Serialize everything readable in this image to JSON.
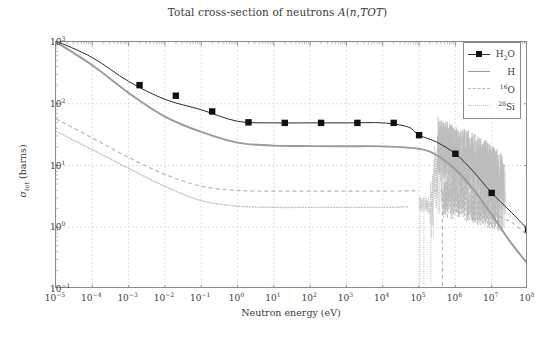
{
  "chart_data": {
    "type": "line",
    "title": "Total cross-section of neutrons A(n,TOT)",
    "xlabel": "Neutron energy (eV)",
    "ylabel": "σ_tot (barns)",
    "xscale": "log",
    "yscale": "log",
    "xlim": [
      1e-05,
      100000000.0
    ],
    "ylim": [
      0.1,
      1000
    ],
    "grid": true,
    "legend_position": "top-right",
    "xticks": [
      "10^-5",
      "10^-4",
      "10^-3",
      "10^-2",
      "10^-1",
      "10^0",
      "10^1",
      "10^2",
      "10^3",
      "10^4",
      "10^5",
      "10^6",
      "10^7",
      "10^8"
    ],
    "yticks": [
      "10^-1",
      "10^0",
      "10^1",
      "10^2",
      "10^3"
    ],
    "series": [
      {
        "name": "H2O",
        "style": "solid-with-square-markers",
        "color": "#2b2b2b",
        "marker_x": [
          0.002,
          0.02,
          0.2,
          2.0,
          20.0,
          200.0,
          2000.0,
          20000.0,
          100000.0,
          1000000.0,
          10000000.0,
          100000000.0
        ],
        "marker_y": [
          200,
          135,
          75,
          50,
          49,
          49,
          49,
          49,
          31,
          15.5,
          3.6,
          0.92
        ],
        "x": [
          1e-05,
          0.0001,
          0.001,
          0.01,
          0.1,
          1.0,
          10.0,
          100.0,
          1000.0,
          10000.0,
          50000.0,
          100000.0,
          300000.0,
          1000000.0,
          3000000.0,
          10000000.0,
          30000000.0,
          100000000.0
        ],
        "y": [
          1040,
          560,
          230,
          118,
          80,
          52,
          49,
          49,
          49,
          49,
          42,
          31,
          24,
          15.5,
          8.2,
          3.6,
          1.9,
          0.92
        ]
      },
      {
        "name": "H",
        "style": "solid",
        "color": "#9a9a9a",
        "x": [
          1e-05,
          0.0001,
          0.001,
          0.01,
          0.1,
          1.0,
          10.0,
          100.0,
          1000.0,
          10000.0,
          100000.0,
          300000.0,
          1000000.0,
          3000000.0,
          10000000.0,
          30000000.0,
          100000000.0
        ],
        "y": [
          1000,
          420,
          150,
          62,
          35,
          23.5,
          21,
          20.6,
          20.5,
          20.4,
          18.6,
          14.8,
          8.6,
          4.2,
          1.6,
          0.62,
          0.25
        ]
      },
      {
        "name": "16O",
        "style": "dashed",
        "color": "#b9b9b9",
        "x": [
          1e-05,
          0.0001,
          0.001,
          0.01,
          0.1,
          1.0,
          10.0,
          100.0,
          1000.0,
          10000.0,
          100000.0,
          400000.0,
          1000000.0,
          2000000.0,
          5000000.0,
          10000000.0,
          30000000.0,
          100000000.0
        ],
        "y": [
          57,
          28,
          13.5,
          7.2,
          4.6,
          3.95,
          3.85,
          3.85,
          3.85,
          3.85,
          3.9,
          0.55,
          2.8,
          1.9,
          1.6,
          1.55,
          1.2,
          0.7
        ],
        "note": "deep narrow resonance dip near 4e5 eV"
      },
      {
        "name": "28Si",
        "style": "dotted",
        "color": "#c2c2c2",
        "x": [
          1e-05,
          0.0001,
          0.001,
          0.01,
          0.1,
          1.0,
          10.0,
          100.0,
          1000.0,
          10000.0,
          50000.0,
          110000.0,
          180000.0,
          300000.0,
          1000000.0,
          3000000.0,
          10000000.0,
          30000000.0,
          100000000.0
        ],
        "y": [
          36,
          18,
          9,
          4.6,
          2.7,
          2.2,
          2.1,
          2.1,
          2.1,
          2.1,
          2.15,
          0.25,
          2.4,
          7.5,
          5.0,
          3.2,
          2.3,
          1.5,
          0.95
        ],
        "note": "strong resonance structure above 1e5 eV"
      }
    ],
    "annotations": {
      "resonance_region": "dense oscillating resonance structure from ~3e5 to ~2e7 eV"
    }
  },
  "legend": {
    "items": [
      {
        "label_html": "H<sub>2</sub>O",
        "style": "solid-with-square-markers"
      },
      {
        "label_html": "H",
        "style": "solid"
      },
      {
        "label_html": "<sup>16</sup>O",
        "style": "dashed"
      },
      {
        "label_html": "<sup>28</sup>Si",
        "style": "dotted"
      }
    ]
  },
  "colors": {
    "background": "#ffffff",
    "frame": "#8a8a8a",
    "grid": "#d9d9e2",
    "text": "#3b3b3b",
    "h2o": "#2b2b2b",
    "h": "#9a9a9a",
    "o16": "#b9b9b9",
    "si28": "#c2c2c2"
  }
}
